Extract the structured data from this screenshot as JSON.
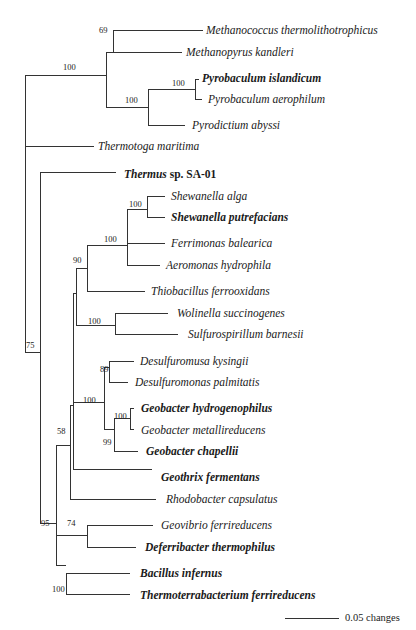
{
  "diagram": {
    "type": "phylogenetic-tree",
    "scale_bar": {
      "label": "0.05 changes"
    },
    "leaves": [
      {
        "id": "methanococcus",
        "label": "Methanococcus thermolithotrophicus",
        "bold": false,
        "x": 206,
        "y": 30
      },
      {
        "id": "methanopyrus",
        "label": "Methanopyrus kandleri",
        "bold": false,
        "x": 186,
        "y": 52
      },
      {
        "id": "pyrobaculum-islandicum",
        "label": "Pyrobaculum islandicum",
        "bold": true,
        "x": 202,
        "y": 78
      },
      {
        "id": "pyrobaculum-aerophilum",
        "label": "Pyrobaculum aerophilum",
        "bold": false,
        "x": 208,
        "y": 99
      },
      {
        "id": "pyrodictium",
        "label": "Pyrodictium abyssi",
        "bold": false,
        "x": 192,
        "y": 125
      },
      {
        "id": "thermotoga",
        "label": "Thermotoga maritima",
        "bold": false,
        "x": 98,
        "y": 146
      },
      {
        "id": "thermus",
        "label": "Thermus",
        "suffix": " sp. SA-01",
        "bold": true,
        "x": 124,
        "y": 174
      },
      {
        "id": "shewanella-alga",
        "label": "Shewanella alga",
        "bold": false,
        "x": 171,
        "y": 196
      },
      {
        "id": "shewanella-putrefacians",
        "label": "Shewanella putrefacians",
        "bold": true,
        "x": 171,
        "y": 217
      },
      {
        "id": "ferrimonas",
        "label": "Ferrimonas balearica",
        "bold": false,
        "x": 171,
        "y": 243
      },
      {
        "id": "aeromonas",
        "label": "Aeromonas hydrophila",
        "bold": false,
        "x": 166,
        "y": 265
      },
      {
        "id": "thiobacillus",
        "label": "Thiobacillus ferrooxidans",
        "bold": false,
        "x": 151,
        "y": 291
      },
      {
        "id": "wolinella",
        "label": "Wolinella succinogenes",
        "bold": false,
        "x": 177,
        "y": 313
      },
      {
        "id": "sulfurospirillum",
        "label": "Sulfurospirillum barnesii",
        "bold": false,
        "x": 188,
        "y": 334
      },
      {
        "id": "desulfuromusa",
        "label": "Desulfuromusa kysingii",
        "bold": false,
        "x": 140,
        "y": 361
      },
      {
        "id": "desulfuromonas",
        "label": "Desulfuromonas palmitatis",
        "bold": false,
        "x": 135,
        "y": 382
      },
      {
        "id": "geobacter-hydrogenophilus",
        "label": "Geobacter hydrogenophilus",
        "bold": true,
        "x": 141,
        "y": 408
      },
      {
        "id": "geobacter-metallireducens",
        "label": "Geobacter metallireducens",
        "bold": false,
        "x": 141,
        "y": 430
      },
      {
        "id": "geobacter-chapellii",
        "label": "Geobacter chapellii",
        "bold": true,
        "x": 146,
        "y": 451
      },
      {
        "id": "geothrix",
        "label": "Geothrix fermentans",
        "bold": true,
        "x": 161,
        "y": 477
      },
      {
        "id": "rhodobacter",
        "label": "Rhodobacter capsulatus",
        "bold": false,
        "x": 166,
        "y": 499
      },
      {
        "id": "geovibrio",
        "label": "Geovibrio ferrireducens",
        "bold": false,
        "x": 161,
        "y": 525
      },
      {
        "id": "deferribacter",
        "label": "Deferribacter thermophilus",
        "bold": true,
        "x": 145,
        "y": 547
      },
      {
        "id": "bacillus",
        "label": "Bacillus infernus",
        "bold": true,
        "x": 140,
        "y": 573
      },
      {
        "id": "thermoterrabacterium",
        "label": "Thermoterrabacterium ferrireducens",
        "bold": true,
        "x": 140,
        "y": 595
      }
    ],
    "support_values": [
      {
        "value": "69",
        "x": 99,
        "y": 26
      },
      {
        "value": "100",
        "x": 63,
        "y": 63
      },
      {
        "value": "100",
        "x": 172,
        "y": 79
      },
      {
        "value": "100",
        "x": 125,
        "y": 96
      },
      {
        "value": "100",
        "x": 129,
        "y": 200
      },
      {
        "value": "100",
        "x": 104,
        "y": 235
      },
      {
        "value": "90",
        "x": 73,
        "y": 256
      },
      {
        "value": "100",
        "x": 88,
        "y": 317
      },
      {
        "value": "75",
        "x": 26,
        "y": 341
      },
      {
        "value": "89",
        "x": 100,
        "y": 365
      },
      {
        "value": "100",
        "x": 83,
        "y": 396
      },
      {
        "value": "100",
        "x": 114,
        "y": 412
      },
      {
        "value": "99",
        "x": 103,
        "y": 438
      },
      {
        "value": "58",
        "x": 57,
        "y": 427
      },
      {
        "value": "95",
        "x": 41,
        "y": 519
      },
      {
        "value": "74",
        "x": 67,
        "y": 519
      },
      {
        "value": "100",
        "x": 52,
        "y": 585
      }
    ]
  },
  "chart_data": {
    "type": "phylogenetic-tree",
    "title": "",
    "scale": "0.05 changes",
    "newick": "((((Methanococcus_thermolithotrophicus,Methanopyrus_kandleri)69,((Pyrobaculum_islandicum,Pyrobaculum_aerophilum)100,Pyrodictium_abyssi)100)100,Thermotoga_maritima,(Thermus_sp_SA-01,((((((Shewanella_alga,Shewanella_putrefacians)100,Ferrimonas_balearica,Aeromonas_hydrophila)100,Thiobacillus_ferrooxidans)90,(Wolinella_succinogenes,Sulfurospirillum_barnesii)100),((Desulfuromusa_kysingii,Desulfuromonas_palmitatis)89,((Geobacter_hydrogenophilus,Geobacter_metallireducens)100,Geobacter_chapellii)99)100,Geothrix_fermentans,Rhodobacter_capsulatus)58,(Geovibrio_ferrireducens,Deferribacter_thermophilus)74,(Bacillus_infernus,Thermoterrabacterium_ferrireducens)100)95)75);",
    "bold_taxa": [
      "Pyrobaculum islandicum",
      "Thermus sp. SA-01",
      "Shewanella putrefacians",
      "Geobacter hydrogenophilus",
      "Geobacter chapellii",
      "Geothrix fermentans",
      "Deferribacter thermophilus",
      "Bacillus infernus",
      "Thermoterrabacterium ferrireducens"
    ]
  }
}
